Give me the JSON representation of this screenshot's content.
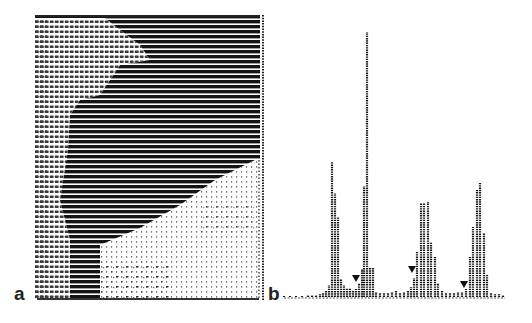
{
  "figure": {
    "panels": [
      {
        "label": "a",
        "description": "ASCII-art line-printer rendering of a grayscale image"
      },
      {
        "label": "b",
        "description": "Line-printer histogram of gray levels"
      }
    ]
  },
  "chart_data": {
    "type": "bar",
    "title": "",
    "xlabel": "",
    "ylabel": "",
    "grid": false,
    "baseline_y_px": 297,
    "bars": [
      {
        "x": 284,
        "h": 1
      },
      {
        "x": 290,
        "h": 1
      },
      {
        "x": 296,
        "h": 1
      },
      {
        "x": 302,
        "h": 1
      },
      {
        "x": 308,
        "h": 2
      },
      {
        "x": 312,
        "h": 2
      },
      {
        "x": 316,
        "h": 2
      },
      {
        "x": 320,
        "h": 3
      },
      {
        "x": 323,
        "h": 4
      },
      {
        "x": 326,
        "h": 7
      },
      {
        "x": 329,
        "h": 12
      },
      {
        "x": 332,
        "h": 135
      },
      {
        "x": 335,
        "h": 104
      },
      {
        "x": 338,
        "h": 80
      },
      {
        "x": 341,
        "h": 18
      },
      {
        "x": 344,
        "h": 12
      },
      {
        "x": 347,
        "h": 9
      },
      {
        "x": 350,
        "h": 9
      },
      {
        "x": 353,
        "h": 6
      },
      {
        "x": 356,
        "h": 8
      },
      {
        "x": 359,
        "h": 14
      },
      {
        "x": 362,
        "h": 28
      },
      {
        "x": 364,
        "h": 111
      },
      {
        "x": 367,
        "h": 265
      },
      {
        "x": 370,
        "h": 30
      },
      {
        "x": 373,
        "h": 30
      },
      {
        "x": 376,
        "h": 5
      },
      {
        "x": 380,
        "h": 4
      },
      {
        "x": 384,
        "h": 4
      },
      {
        "x": 388,
        "h": 4
      },
      {
        "x": 392,
        "h": 5
      },
      {
        "x": 396,
        "h": 6
      },
      {
        "x": 400,
        "h": 4
      },
      {
        "x": 404,
        "h": 5
      },
      {
        "x": 408,
        "h": 7
      },
      {
        "x": 411,
        "h": 10
      },
      {
        "x": 414,
        "h": 19
      },
      {
        "x": 417,
        "h": 45
      },
      {
        "x": 421,
        "h": 94
      },
      {
        "x": 424,
        "h": 94
      },
      {
        "x": 428,
        "h": 95
      },
      {
        "x": 431,
        "h": 55
      },
      {
        "x": 435,
        "h": 40
      },
      {
        "x": 438,
        "h": 14
      },
      {
        "x": 442,
        "h": 6
      },
      {
        "x": 446,
        "h": 4
      },
      {
        "x": 450,
        "h": 4
      },
      {
        "x": 454,
        "h": 4
      },
      {
        "x": 458,
        "h": 5
      },
      {
        "x": 462,
        "h": 5
      },
      {
        "x": 466,
        "h": 8
      },
      {
        "x": 470,
        "h": 40
      },
      {
        "x": 473,
        "h": 70
      },
      {
        "x": 477,
        "h": 107
      },
      {
        "x": 480,
        "h": 114
      },
      {
        "x": 484,
        "h": 64
      },
      {
        "x": 487,
        "h": 23
      },
      {
        "x": 491,
        "h": 4
      },
      {
        "x": 495,
        "h": 3
      },
      {
        "x": 499,
        "h": 3
      },
      {
        "x": 503,
        "h": 2
      }
    ],
    "markers": [
      {
        "shape": "triangle-down",
        "x": 356,
        "y": 279
      },
      {
        "shape": "triangle-down",
        "x": 412,
        "y": 270
      },
      {
        "shape": "triangle-down",
        "x": 464,
        "y": 285
      }
    ],
    "peaks": [
      {
        "x": 332,
        "top_y": 162
      },
      {
        "x": 367,
        "top_y": 32
      },
      {
        "x": 424,
        "top_y": 203
      },
      {
        "x": 480,
        "top_y": 183
      }
    ]
  }
}
